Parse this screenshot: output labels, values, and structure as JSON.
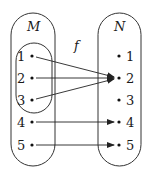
{
  "diagram": {
    "function_label": "f",
    "domain": {
      "name": "M",
      "elements": [
        "1",
        "2",
        "3",
        "4",
        "5"
      ],
      "subset": [
        "1",
        "2",
        "3"
      ]
    },
    "codomain": {
      "name": "N",
      "elements": [
        "1",
        "2",
        "3",
        "4",
        "5"
      ]
    },
    "mapping": [
      {
        "from": "1",
        "to": "2"
      },
      {
        "from": "2",
        "to": "2"
      },
      {
        "from": "3",
        "to": "2"
      },
      {
        "from": "4",
        "to": "4"
      },
      {
        "from": "5",
        "to": "5"
      }
    ],
    "colors": {
      "stroke": "#333333",
      "background": "#ffffff"
    }
  }
}
